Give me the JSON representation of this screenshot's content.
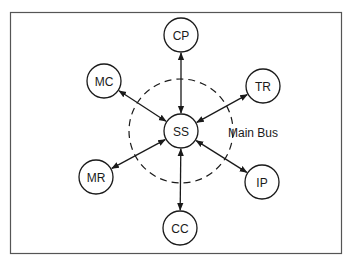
{
  "diagram": {
    "hub": {
      "id": "SS",
      "label": "SS",
      "cx": 181,
      "cy": 131
    },
    "bus": {
      "label": "Main Bus",
      "cx": 181,
      "cy": 131,
      "r": 52
    },
    "nodes": [
      {
        "id": "CP",
        "label": "CP",
        "cx": 181,
        "cy": 35
      },
      {
        "id": "MC",
        "label": "MC",
        "cx": 104,
        "cy": 81
      },
      {
        "id": "TR",
        "label": "TR",
        "cx": 263,
        "cy": 86
      },
      {
        "id": "MR",
        "label": "MR",
        "cx": 96,
        "cy": 177
      },
      {
        "id": "IP",
        "label": "IP",
        "cx": 262,
        "cy": 182
      },
      {
        "id": "CC",
        "label": "CC",
        "cx": 180,
        "cy": 228
      }
    ],
    "edges": [
      {
        "from": "SS",
        "to": "CP",
        "bidirectional": true
      },
      {
        "from": "SS",
        "to": "MC",
        "bidirectional": true
      },
      {
        "from": "SS",
        "to": "TR",
        "bidirectional": true
      },
      {
        "from": "SS",
        "to": "MR",
        "bidirectional": true
      },
      {
        "from": "SS",
        "to": "IP",
        "bidirectional": true
      },
      {
        "from": "SS",
        "to": "CC",
        "bidirectional": true
      }
    ]
  }
}
